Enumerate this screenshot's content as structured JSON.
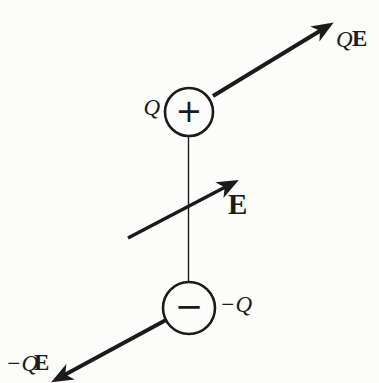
{
  "diagram": {
    "description_colors": {
      "ink": "#1b1b1b",
      "background": "#fcfcfa"
    },
    "charges": {
      "positive": {
        "label": "Q",
        "sign": "+"
      },
      "negative": {
        "label": "−Q",
        "sign": "−"
      }
    },
    "field_label": "E",
    "forces": {
      "top": {
        "q_part": "Q",
        "e_part": "E"
      },
      "bottom": {
        "q_part": "−Q",
        "e_part": "E"
      }
    }
  }
}
